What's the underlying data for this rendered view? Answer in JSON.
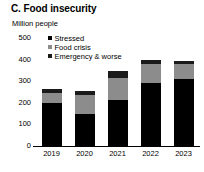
{
  "panel": {
    "title": "C. Food insecurity"
  },
  "chart_data": {
    "type": "bar",
    "subtype": "stacked-vertical",
    "title": "C. Food insecurity",
    "subtitle": "",
    "xlabel": "",
    "ylabel": "Million people",
    "unit_label": "Million people",
    "categories": [
      "2019",
      "2020",
      "2021",
      "2022",
      "2023"
    ],
    "series": [
      {
        "name": "Stressed",
        "color": "#000000",
        "values": [
          200,
          150,
          215,
          290,
          310
        ]
      },
      {
        "name": "Food crisis",
        "color": "#8c8c8c",
        "values": [
          45,
          85,
          100,
          90,
          70
        ]
      },
      {
        "name": "Emergency & worse",
        "color": "#1a1a1a",
        "values": [
          17,
          20,
          33,
          20,
          15
        ]
      }
    ],
    "totals": [
      262,
      255,
      348,
      400,
      395
    ],
    "ylim": [
      0,
      500
    ],
    "yticks": [
      0,
      100,
      200,
      300,
      400,
      500
    ],
    "ytick_labels": [
      "0",
      "100",
      "200",
      "300",
      "400",
      "500"
    ],
    "grid": false,
    "legend_position": "top-left-inside",
    "legend": [
      "Stressed",
      "Food crisis",
      "Emergency & worse"
    ]
  },
  "colors": {
    "stressed": "#000000",
    "food_crisis": "#8c8c8c",
    "emergency": "#1a1a1a",
    "axis": "#000000",
    "background": "#ffffff"
  }
}
